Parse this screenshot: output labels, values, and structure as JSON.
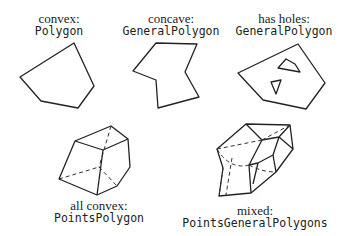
{
  "panels": [
    {
      "id": "convex",
      "kind": "convex:",
      "cls": "Polygon"
    },
    {
      "id": "concave",
      "kind": "concave:",
      "cls": "GeneralPolygon"
    },
    {
      "id": "holes",
      "kind": "has holes:",
      "cls": "GeneralPolygon"
    },
    {
      "id": "all-convex",
      "kind": "all convex:",
      "cls": "PointsPolygon"
    },
    {
      "id": "mixed",
      "kind": "mixed:",
      "cls": "PointsGeneralPolygons"
    }
  ],
  "colors": {
    "line": "#222222",
    "background": "#ffffff"
  }
}
